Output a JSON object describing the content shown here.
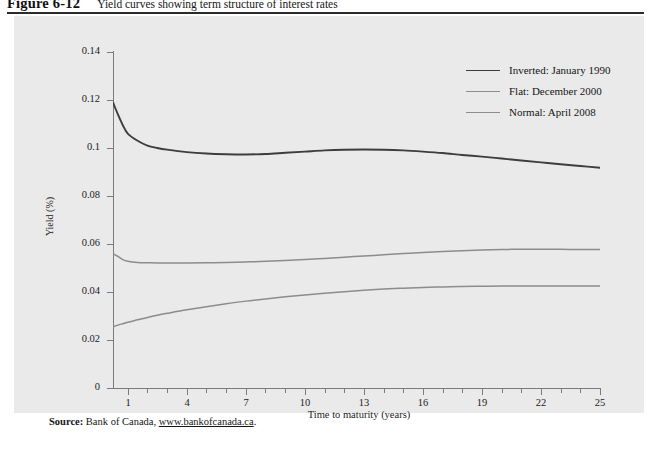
{
  "figure": {
    "number": "Figure 6-12",
    "title": "Yield curves showing term structure of interest rates"
  },
  "source": {
    "label": "Source:",
    "text": "Bank of Canada,",
    "url": "www.bankofcanada.ca",
    "period": "."
  },
  "colors": {
    "panel": "#eaeaea",
    "axis": "#7b7b7b",
    "inverted": "#3d3d3d",
    "flat": "#8c8c8c",
    "normal": "#8c8c8c",
    "rule": "#2b2b2b"
  },
  "chart_data": {
    "type": "line",
    "title": "Yield curves showing term structure of interest rates",
    "xlabel": "Time to maturity (years)",
    "ylabel": "Yield (%)",
    "xlim": [
      0.25,
      25
    ],
    "ylim": [
      0,
      0.14
    ],
    "grid": false,
    "legend_position": "top-right",
    "yticks": [
      0,
      0.02,
      0.04,
      0.06,
      0.08,
      0.1,
      0.12,
      0.14
    ],
    "ytick_labels": [
      "0",
      "0.02",
      "0.04",
      "0.06",
      "0.08",
      "0.1",
      "0.12",
      "0.14"
    ],
    "xticks_major": [
      1,
      4,
      7,
      10,
      13,
      16,
      19,
      22,
      25
    ],
    "xtick_labels": [
      "1",
      "4",
      "7",
      "10",
      "13",
      "16",
      "19",
      "22",
      "25"
    ],
    "xticks_minor": [
      2,
      3,
      5,
      6,
      8,
      9,
      11,
      12,
      14,
      15,
      17,
      18,
      20,
      21,
      23,
      24
    ],
    "series": [
      {
        "name": "Inverted: January 1990",
        "color": "#3d3d3d",
        "width": 1.9,
        "x": [
          0.25,
          0.5,
          0.75,
          1,
          1.5,
          2,
          2.5,
          3,
          4,
          5,
          6,
          7,
          8,
          9,
          10,
          11,
          12,
          13,
          14,
          15,
          16,
          17,
          18,
          19,
          20,
          21,
          22,
          23,
          24,
          25
        ],
        "y": [
          0.119,
          0.114,
          0.1095,
          0.106,
          0.103,
          0.101,
          0.1,
          0.0993,
          0.0983,
          0.0977,
          0.0974,
          0.0973,
          0.0975,
          0.098,
          0.0985,
          0.099,
          0.0993,
          0.0994,
          0.0993,
          0.099,
          0.0985,
          0.0979,
          0.0971,
          0.0964,
          0.0956,
          0.0948,
          0.094,
          0.0932,
          0.0925,
          0.0918
        ]
      },
      {
        "name": "Flat: December 2000",
        "color": "#8c8c8c",
        "width": 1.5,
        "x": [
          0.25,
          0.5,
          0.75,
          1,
          1.5,
          2,
          2.5,
          3,
          4,
          5,
          6,
          7,
          8,
          9,
          10,
          11,
          12,
          13,
          14,
          15,
          16,
          17,
          18,
          19,
          20,
          21,
          22,
          23,
          24,
          25
        ],
        "y": [
          0.056,
          0.0548,
          0.0535,
          0.0528,
          0.0523,
          0.0522,
          0.0521,
          0.0521,
          0.0521,
          0.0522,
          0.0523,
          0.0525,
          0.0528,
          0.0531,
          0.0535,
          0.054,
          0.0545,
          0.055,
          0.0555,
          0.056,
          0.0565,
          0.0569,
          0.0572,
          0.0575,
          0.0577,
          0.0578,
          0.0578,
          0.0578,
          0.0577,
          0.0577
        ]
      },
      {
        "name": "Normal: April 2008",
        "color": "#8c8c8c",
        "width": 1.5,
        "x": [
          0.25,
          0.5,
          0.75,
          1,
          1.5,
          2,
          2.5,
          3,
          4,
          5,
          6,
          7,
          8,
          9,
          10,
          11,
          12,
          13,
          14,
          15,
          16,
          17,
          18,
          19,
          20,
          21,
          22,
          23,
          24,
          25
        ],
        "y": [
          0.0255,
          0.0262,
          0.0268,
          0.0274,
          0.0284,
          0.0294,
          0.0303,
          0.0311,
          0.0326,
          0.0339,
          0.0351,
          0.0362,
          0.0371,
          0.038,
          0.0388,
          0.0395,
          0.0401,
          0.0407,
          0.0412,
          0.0416,
          0.0419,
          0.0421,
          0.0423,
          0.0424,
          0.0425,
          0.0425,
          0.0425,
          0.0425,
          0.0425,
          0.0425
        ]
      }
    ]
  }
}
